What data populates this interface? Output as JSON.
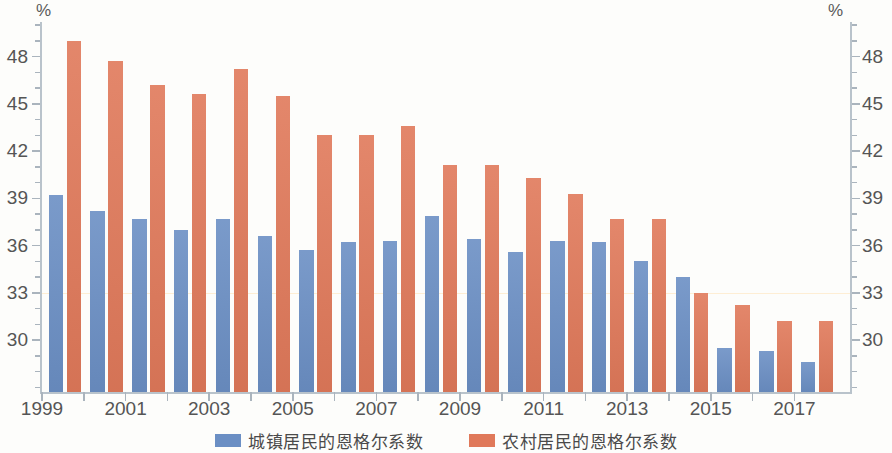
{
  "chart_data": {
    "type": "bar",
    "title": "",
    "xlabel": "",
    "ylabel": "%",
    "y_unit_left": "%",
    "y_unit_right": "%",
    "ylim": [
      26.7,
      50.2
    ],
    "yticks": [
      30,
      33,
      36,
      39,
      42,
      45,
      48
    ],
    "ytick_labels": [
      "30",
      "33",
      "36",
      "39",
      "42",
      "45",
      "48"
    ],
    "minor_ticks": true,
    "grid": false,
    "legend_position": "bottom-center",
    "categories": [
      1999,
      2000,
      2001,
      2002,
      2003,
      2004,
      2005,
      2006,
      2007,
      2008,
      2009,
      2010,
      2011,
      2012,
      2013,
      2014,
      2015,
      2016,
      2017
    ],
    "xtick_labels": [
      "1999",
      "",
      "2001",
      "",
      "2003",
      "",
      "2005",
      "",
      "2007",
      "",
      "2009",
      "",
      "2011",
      "",
      "2013",
      "",
      "2015",
      "",
      "2017"
    ],
    "xticks_shown": [
      "1999",
      "2001",
      "2003",
      "2005",
      "2007",
      "2009",
      "2011",
      "2013",
      "2015",
      "2017"
    ],
    "series": [
      {
        "name": "城镇居民的恩格尔系数",
        "color": "#6b8fc4",
        "values": [
          39.2,
          38.2,
          37.7,
          37.0,
          37.7,
          36.6,
          35.7,
          36.2,
          36.3,
          37.9,
          36.4,
          35.6,
          36.3,
          36.2,
          35.0,
          34.0,
          29.5,
          29.3,
          28.6
        ]
      },
      {
        "name": "农村居民的恩格尔系数",
        "color": "#e0795a",
        "values": [
          49.0,
          47.7,
          46.2,
          45.6,
          47.2,
          45.5,
          43.0,
          43.0,
          43.6,
          41.1,
          41.1,
          40.3,
          39.3,
          37.7,
          37.7,
          33.0,
          32.2,
          31.2,
          31.2
        ]
      }
    ]
  },
  "legend": {
    "items": [
      {
        "label": "城镇居民的恩格尔系数",
        "swatch": "urban"
      },
      {
        "label": "农村居民的恩格尔系数",
        "swatch": "rural"
      }
    ]
  },
  "axes": {
    "unit_left": "%",
    "unit_right": "%"
  }
}
